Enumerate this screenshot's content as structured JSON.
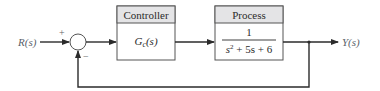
{
  "diagram": {
    "type": "block-diagram",
    "input_label": "R(s)",
    "output_label": "Y(s)",
    "summing_junction": {
      "plus_sign": "+",
      "minus_sign": "−"
    },
    "blocks": [
      {
        "id": "controller",
        "title": "Controller",
        "transfer_function": "Gc(s)",
        "tf_main": "G",
        "tf_sub": "c",
        "tf_arg": "(s)"
      },
      {
        "id": "process",
        "title": "Process",
        "numerator": "1",
        "denominator": "s² + 5s + 6",
        "den_s": "s",
        "den_exp": "2",
        "den_rest": " + 5s + 6"
      }
    ],
    "feedback": "unity negative feedback",
    "colors": {
      "line": "#2b2b2b",
      "box_border": "#555555",
      "header_fill": "#e4e4e6",
      "label": "#5a5f6a"
    }
  }
}
